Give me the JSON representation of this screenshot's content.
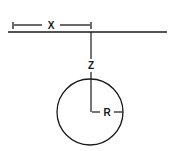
{
  "diagram": {
    "labels": {
      "horizontal_distance": "X",
      "depth": "Z",
      "radius": "R"
    },
    "colors": {
      "stroke": "#1a1a1a",
      "background": "#ffffff"
    }
  }
}
